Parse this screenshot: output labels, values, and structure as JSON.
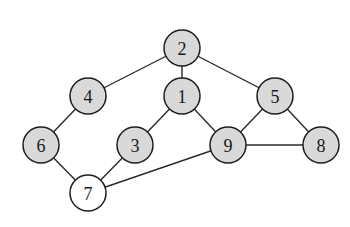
{
  "diagram": {
    "type": "undirected-graph",
    "colors": {
      "filled": "#d9d9d9",
      "unfilled": "#ffffff",
      "stroke": "#1e1e1e",
      "edge": "#2a2a2a"
    },
    "node_radius": 18,
    "nodes": [
      {
        "id": "1",
        "label": "1",
        "x": 182,
        "y": 96,
        "shaded": true
      },
      {
        "id": "2",
        "label": "2",
        "x": 182,
        "y": 48,
        "shaded": true
      },
      {
        "id": "3",
        "label": "3",
        "x": 135,
        "y": 145,
        "shaded": true
      },
      {
        "id": "4",
        "label": "4",
        "x": 88,
        "y": 96,
        "shaded": true
      },
      {
        "id": "5",
        "label": "5",
        "x": 275,
        "y": 96,
        "shaded": true
      },
      {
        "id": "6",
        "label": "6",
        "x": 41,
        "y": 145,
        "shaded": true
      },
      {
        "id": "7",
        "label": "7",
        "x": 88,
        "y": 193,
        "shaded": false
      },
      {
        "id": "8",
        "label": "8",
        "x": 321,
        "y": 145,
        "shaded": true
      },
      {
        "id": "9",
        "label": "9",
        "x": 228,
        "y": 145,
        "shaded": true
      }
    ],
    "edges": [
      {
        "from": "2",
        "to": "4"
      },
      {
        "from": "2",
        "to": "1"
      },
      {
        "from": "2",
        "to": "5"
      },
      {
        "from": "4",
        "to": "6"
      },
      {
        "from": "1",
        "to": "3"
      },
      {
        "from": "1",
        "to": "9"
      },
      {
        "from": "5",
        "to": "9"
      },
      {
        "from": "5",
        "to": "8"
      },
      {
        "from": "9",
        "to": "8"
      },
      {
        "from": "6",
        "to": "7"
      },
      {
        "from": "3",
        "to": "7"
      },
      {
        "from": "9",
        "to": "7"
      }
    ]
  }
}
